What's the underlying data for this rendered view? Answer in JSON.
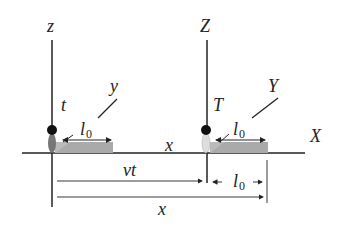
{
  "diagram": {
    "frame_s": {
      "vertical_axis_label": "z",
      "depth_axis_label": "y",
      "time_label": "t"
    },
    "frame_s_prime": {
      "vertical_axis_label": "Z",
      "depth_axis_label": "Y",
      "time_label": "T",
      "horizontal_axis_label": "X"
    },
    "horizontal_axis_label": "x",
    "rod_length_label": "l",
    "rod_length_subscript": "0",
    "dimensions": {
      "vt_label": "vt",
      "x_label": "x",
      "l0_label": "l",
      "l0_subscript": "0"
    },
    "colors": {
      "axis": "#222222",
      "rod": "#aaaaaa",
      "clock_ball": "#111111",
      "observer_left": "#777777",
      "observer_right": "#dddddd"
    }
  }
}
